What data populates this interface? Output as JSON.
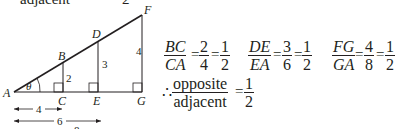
{
  "header_fragment": {
    "left_text": "adjacent",
    "right_text": "2"
  },
  "diagram": {
    "points": {
      "A": "A",
      "B": "B",
      "C": "C",
      "D": "D",
      "E": "E",
      "F": "F",
      "G": "G"
    },
    "angle_label": "θ",
    "side_labels": {
      "BC": "2",
      "DE": "3",
      "FG": "4"
    },
    "dimensions": [
      {
        "label": "4",
        "from": "A",
        "to": "C"
      },
      {
        "label": "6",
        "from": "A",
        "to": "E"
      },
      {
        "label": "8",
        "from": "A",
        "to": "G"
      }
    ]
  },
  "ratios": [
    {
      "num": "BC",
      "den": "CA",
      "n1": "2",
      "d1": "4",
      "n2": "1",
      "d2": "2"
    },
    {
      "num": "DE",
      "den": "EA",
      "n1": "3",
      "d1": "6",
      "n2": "1",
      "d2": "2"
    },
    {
      "num": "FG",
      "den": "GA",
      "n1": "4",
      "d1": "8",
      "n2": "1",
      "d2": "2"
    }
  ],
  "conclusion": {
    "therefore": "∴",
    "num": "opposite",
    "den": "adjacent",
    "rn": "1",
    "rd": "2"
  },
  "eq_sign": "="
}
